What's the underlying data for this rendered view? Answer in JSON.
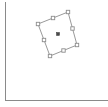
{
  "app": {
    "title": "Canvas Selection",
    "background_color": "#ffffff"
  },
  "frame": {
    "name": "canvas-frame",
    "left_rule_color": "#8a8a8a",
    "bottom_rule_color": "#8a8a8a",
    "left_rule_x": 5,
    "bottom_rule_y": 100,
    "width": 108,
    "height": 107
  },
  "canvas": {
    "name": "canvas-surface",
    "fill": "#ffffff",
    "x": 6,
    "y": 0,
    "width": 102,
    "height": 100
  },
  "selection": {
    "name": "rotated-selection-box",
    "shape": "quadrilateral",
    "outline_color": "#9a9a9a",
    "outline_width": 1,
    "handle_fill": "#ffffff",
    "handle_stroke": "#8d8d8d",
    "handle_size": 3.4,
    "rotation_degrees": 22,
    "corners": [
      {
        "label": "top",
        "x": 68,
        "y": 12
      },
      {
        "label": "right",
        "x": 77,
        "y": 45
      },
      {
        "label": "bottom",
        "x": 50,
        "y": 56
      },
      {
        "label": "left",
        "x": 38,
        "y": 24
      }
    ],
    "midpoints": [
      {
        "label": "top-right-mid",
        "x": 72.5,
        "y": 28.5
      },
      {
        "label": "bottom-right-mid",
        "x": 63.5,
        "y": 50.5
      },
      {
        "label": "bottom-left-mid",
        "x": 44,
        "y": 40
      },
      {
        "label": "top-left-mid",
        "x": 53,
        "y": 18
      }
    ],
    "pivot": {
      "label": "center-pivot",
      "x": 58,
      "y": 34,
      "color": "#4a4a4a",
      "size": 3
    }
  }
}
